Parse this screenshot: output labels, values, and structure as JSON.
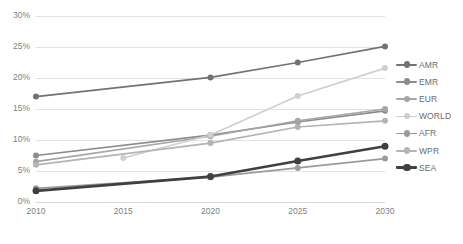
{
  "chart_data": {
    "type": "line",
    "title": "",
    "xlabel": "",
    "ylabel": "",
    "x": [
      2010,
      2015,
      2020,
      2025,
      2030
    ],
    "categories": [
      "2010",
      "2015",
      "2020",
      "2025",
      "2030"
    ],
    "xtick_labels": [
      "2010",
      "2015",
      "2020",
      "2025",
      "2030"
    ],
    "ytick_labels": [
      "0%",
      "5%",
      "10%",
      "15%",
      "20%",
      "25%",
      "30%"
    ],
    "ytick_values": [
      0,
      5,
      10,
      15,
      20,
      25,
      30
    ],
    "ylim": [
      0,
      30
    ],
    "xlim": [
      2010,
      2030
    ],
    "grid": "horizontal",
    "legend_position": "right",
    "value_unit": "%",
    "series": [
      {
        "name": "AMR",
        "color": "#767171",
        "width": 1.7,
        "values": [
          17.0,
          null,
          20.1,
          22.5,
          25.1
        ]
      },
      {
        "name": "EMR",
        "color": "#8c8c8c",
        "width": 1.7,
        "values": [
          7.5,
          null,
          10.8,
          12.9,
          14.7
        ]
      },
      {
        "name": "EUR",
        "color": "#a6a6a6",
        "width": 1.7,
        "values": [
          6.5,
          null,
          10.6,
          13.1,
          15.0
        ]
      },
      {
        "name": "WORLD",
        "color": "#cfcfcf",
        "width": 1.7,
        "values": [
          null,
          7.1,
          10.8,
          17.1,
          21.6
        ]
      },
      {
        "name": "AFR",
        "color": "#9b9b9b",
        "width": 1.7,
        "values": [
          2.2,
          null,
          4.0,
          5.5,
          7.0
        ]
      },
      {
        "name": "WPR",
        "color": "#b4b4b4",
        "width": 1.7,
        "values": [
          6.0,
          null,
          9.5,
          12.1,
          13.1
        ]
      },
      {
        "name": "SEA",
        "color": "#404040",
        "width": 2.6,
        "values": [
          1.8,
          null,
          4.1,
          6.6,
          9.0
        ]
      }
    ]
  },
  "legend": {
    "items": [
      {
        "label": "AMR"
      },
      {
        "label": "EMR"
      },
      {
        "label": "EUR"
      },
      {
        "label": "WORLD"
      },
      {
        "label": "AFR"
      },
      {
        "label": "WPR"
      },
      {
        "label": "SEA"
      }
    ]
  },
  "colors": {
    "background": "#ffffff",
    "gridline": "#e2e2e2",
    "tick_text": "#7f7f7f",
    "legend_text": "#6b6b6b"
  }
}
